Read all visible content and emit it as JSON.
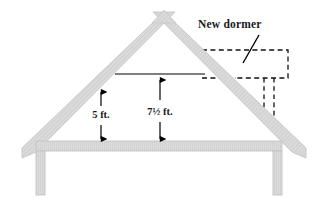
{
  "diagram": {
    "background_color": "#ffffff",
    "structure_fill": "#dcdcdc",
    "structure_stroke": "#c8c8c8",
    "line_color": "#000000",
    "dashed_color": "#000000",
    "callout": {
      "label": "New dormer",
      "icon": "leader-line"
    },
    "dimensions": [
      {
        "id": "side-height",
        "label": "5 ft.",
        "type": "vertical-double-arrow"
      },
      {
        "id": "center-height",
        "label": "7½ ft.",
        "type": "vertical-double-arrow"
      }
    ],
    "elements": {
      "roof_name": "gable-roof",
      "floor_name": "attic-floor-beam",
      "left_post_name": "left-wall-post",
      "right_post_name": "right-wall-post",
      "ceiling_line_name": "ceiling-reference-line",
      "dormer_name": "new-dormer-outline"
    }
  }
}
